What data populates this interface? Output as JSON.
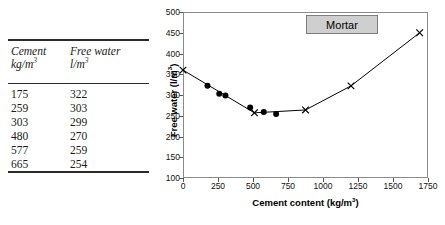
{
  "table": {
    "headers": [
      {
        "name": "Cement",
        "unit": "kg/m",
        "exp": "3"
      },
      {
        "name": "Free water",
        "unit": "l/m",
        "exp": "3"
      }
    ],
    "rows": [
      {
        "cement": "175",
        "water": "322"
      },
      {
        "cement": "259",
        "water": "303"
      },
      {
        "cement": "303",
        "water": "299"
      },
      {
        "cement": "480",
        "water": "270"
      },
      {
        "cement": "577",
        "water": "259"
      },
      {
        "cement": "665",
        "water": "254"
      }
    ]
  },
  "chart": {
    "legend_label": "Mortar",
    "xlabel_text": "Cement content (kg/m",
    "xlabel_exp": "3",
    "xlabel_tail": ")",
    "ylabel_text": "Free water (l/m",
    "ylabel_exp": "3",
    "ylabel_tail": ")"
  },
  "chart_data": {
    "type": "scatter",
    "title": "",
    "legend_entries": [
      "Mortar"
    ],
    "legend_position": "top-right",
    "grid": false,
    "xlabel": "Cement content (kg/m3)",
    "ylabel": "Free water (l/m3)",
    "xlim": [
      0,
      1750
    ],
    "ylim": [
      100,
      500
    ],
    "xticks": [
      0,
      250,
      500,
      750,
      1000,
      1250,
      1500,
      1750
    ],
    "yticks": [
      100,
      150,
      200,
      250,
      300,
      350,
      400,
      450,
      500
    ],
    "series": [
      {
        "name": "Mortar fitted curve (cross markers)",
        "marker": "x",
        "line": true,
        "x": [
          0,
          510,
          875,
          1200,
          1690
        ],
        "y": [
          360,
          257,
          264,
          322,
          450
        ]
      },
      {
        "name": "Measured data (filled circles)",
        "marker": "circle-filled",
        "line": false,
        "x": [
          175,
          259,
          303,
          480,
          577,
          665
        ],
        "y": [
          322,
          303,
          299,
          270,
          259,
          254
        ]
      }
    ]
  }
}
